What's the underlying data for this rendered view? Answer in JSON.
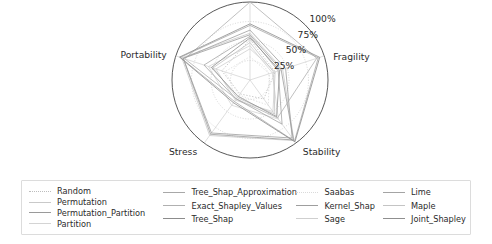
{
  "chart_data": {
    "type": "radar",
    "title": "",
    "categories": [
      "Transparency",
      "Fragility",
      "Stability",
      "Stress",
      "Portability"
    ],
    "visible_categories": [
      "Fragility",
      "Stability",
      "Stress",
      "Portability"
    ],
    "tick_labels": [
      "25%",
      "50%",
      "75%",
      "100%"
    ],
    "tick_values": [
      25,
      50,
      75,
      100
    ],
    "rlim": [
      0,
      100
    ],
    "grid": true,
    "legend_position": "below",
    "series": [
      {
        "name": "Random",
        "color": "#bdbdbd",
        "dash": "dotted",
        "values": [
          52,
          34,
          30,
          22,
          38
        ]
      },
      {
        "name": "Permutation",
        "color": "#c9c9c9",
        "dash": "solid",
        "values": [
          60,
          44,
          96,
          88,
          92
        ]
      },
      {
        "name": "Permutation_Partition",
        "color": "#9a9a9a",
        "dash": "solid",
        "values": [
          58,
          42,
          95,
          86,
          90
        ]
      },
      {
        "name": "Partition",
        "color": "#d4d4d4",
        "dash": "solid",
        "values": [
          44,
          30,
          62,
          40,
          56
        ]
      },
      {
        "name": "Tree_Shap_Approximation",
        "color": "#a8a8a8",
        "dash": "solid",
        "values": [
          70,
          92,
          97,
          34,
          94
        ]
      },
      {
        "name": "Exact_Shapley_Values",
        "color": "#b0b0b0",
        "dash": "solid",
        "values": [
          100,
          90,
          60,
          30,
          88
        ]
      },
      {
        "name": "Tree_Shap",
        "color": "#8c8c8c",
        "dash": "solid",
        "values": [
          72,
          94,
          98,
          36,
          95
        ]
      },
      {
        "name": "Saabas",
        "color": "#dadada",
        "dash": "dotted",
        "values": [
          30,
          26,
          40,
          24,
          34
        ]
      },
      {
        "name": "Kernel_Shap",
        "color": "#9e9e9e",
        "dash": "solid",
        "values": [
          64,
          48,
          92,
          84,
          90
        ]
      },
      {
        "name": "Sage",
        "color": "#cfcfcf",
        "dash": "solid",
        "values": [
          40,
          34,
          50,
          32,
          46
        ]
      },
      {
        "name": "Lime",
        "color": "#a4a4a4",
        "dash": "solid",
        "values": [
          56,
          38,
          70,
          30,
          62
        ]
      },
      {
        "name": "Maple",
        "color": "#c4c4c4",
        "dash": "solid",
        "values": [
          48,
          32,
          54,
          28,
          50
        ]
      },
      {
        "name": "Joint_Shapley",
        "color": "#8f8f8f",
        "dash": "solid",
        "values": [
          54,
          40,
          58,
          26,
          52
        ]
      }
    ]
  },
  "axis_labels": {
    "fragility": "Fragility",
    "stability": "Stability",
    "stress": "Stress",
    "portability": "Portability"
  },
  "radial_ticks": {
    "t100": "100%",
    "t75": "75%",
    "t50": "50%",
    "t25": "25%"
  },
  "legend": {
    "columns": [
      {
        "items": [
          {
            "label": "Random",
            "color": "#bdbdbd",
            "dash": "dotted"
          },
          {
            "label": "Permutation",
            "color": "#c9c9c9",
            "dash": "solid"
          },
          {
            "label": "Permutation_Partition",
            "color": "#9a9a9a",
            "dash": "solid"
          },
          {
            "label": "Partition",
            "color": "#d4d4d4",
            "dash": "solid"
          }
        ]
      },
      {
        "items": [
          {
            "label": "Tree_Shap_Approximation",
            "color": "#a8a8a8",
            "dash": "solid"
          },
          {
            "label": "Exact_Shapley_Values",
            "color": "#b0b0b0",
            "dash": "solid"
          },
          {
            "label": "Tree_Shap",
            "color": "#8c8c8c",
            "dash": "solid"
          }
        ]
      },
      {
        "items": [
          {
            "label": "Saabas",
            "color": "#dadada",
            "dash": "dotted"
          },
          {
            "label": "Kernel_Shap",
            "color": "#9e9e9e",
            "dash": "solid"
          },
          {
            "label": "Sage",
            "color": "#cfcfcf",
            "dash": "solid"
          }
        ]
      },
      {
        "items": [
          {
            "label": "Lime",
            "color": "#a4a4a4",
            "dash": "solid"
          },
          {
            "label": "Maple",
            "color": "#c4c4c4",
            "dash": "solid"
          },
          {
            "label": "Joint_Shapley",
            "color": "#8f8f8f",
            "dash": "solid"
          }
        ]
      }
    ]
  }
}
